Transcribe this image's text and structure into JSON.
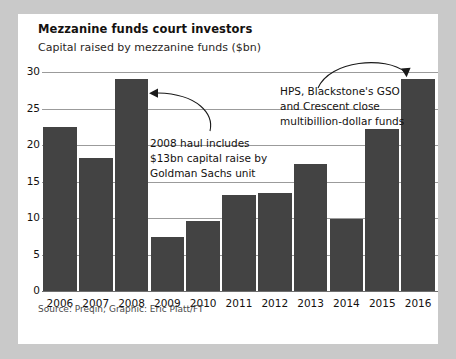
{
  "chart_data": {
    "type": "bar",
    "title": "Mezzanine funds court investors",
    "subtitle": "Capital raised by mezzanine funds ($bn)",
    "xlabel": "",
    "ylabel": "",
    "categories": [
      "2006",
      "2007",
      "2008",
      "2009",
      "2010",
      "2011",
      "2012",
      "2013",
      "2014",
      "2015",
      "2016"
    ],
    "values": [
      22.5,
      18.2,
      29.0,
      7.4,
      9.6,
      13.2,
      13.4,
      17.4,
      9.8,
      22.2,
      29.0
    ],
    "ylim": [
      0,
      30
    ],
    "yticks": [
      0,
      5,
      10,
      15,
      20,
      25,
      30
    ],
    "ytick_labels": [
      "0",
      "5",
      "10",
      "15",
      "20",
      "25",
      "30"
    ],
    "grid": true,
    "legend": false,
    "bar_color": "#434343",
    "annotations": [
      {
        "name": "annotation-2008",
        "lines": [
          "2008 haul includes",
          "$13bn capital raise by",
          "Goldman Sachs unit"
        ],
        "points_to": "2008"
      },
      {
        "name": "annotation-2016",
        "lines": [
          "HPS, Blackstone's GSO",
          "and Crescent close",
          "multibillion-dollar funds"
        ],
        "points_to": "2016"
      }
    ]
  },
  "source": "Source: Preqin; Graphic: Eric Platt/FT"
}
